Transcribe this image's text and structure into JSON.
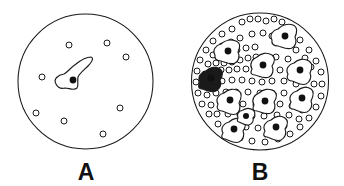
{
  "figure": {
    "background_color": "#ffffff",
    "line_color": "#1a1a1a",
    "width": 344,
    "height": 186
  },
  "panels": [
    {
      "id": "panel-a",
      "label": "A",
      "label_x": 86,
      "label_y": 180,
      "description": "Sparse culture: few round cells and a single spread amoeboid cell",
      "dish": {
        "cx": 85.5,
        "cy": 81.5,
        "r": 67.5
      },
      "bead_count": 8,
      "amoeba_count": 1,
      "beads": [
        {
          "cx": 69,
          "cy": 45,
          "r": 3.0
        },
        {
          "cx": 107,
          "cy": 43,
          "r": 3.0
        },
        {
          "cx": 126,
          "cy": 57,
          "r": 3.0
        },
        {
          "cx": 42,
          "cy": 77,
          "r": 3.0
        },
        {
          "cx": 120,
          "cy": 108,
          "r": 3.0
        },
        {
          "cx": 36,
          "cy": 113,
          "r": 3.0
        },
        {
          "cx": 64,
          "cy": 121,
          "r": 3.0
        },
        {
          "cx": 103,
          "cy": 134,
          "r": 3.0
        }
      ],
      "amoebae": [
        {
          "nucleus": {
            "cx": 73,
            "cy": 80,
            "r": 3.4
          },
          "filled": false,
          "path": "M 56 84 C 53 79 58 75 64 74 C 68 72 70 68 76 64 C 81 60 87 57 91 57 C 94 58 92 62 88 66 C 84 70 80 73 78 77 C 77 81 79 85 77 88 C 74 91 69 88 65 88 C 61 89 58 88 56 84 Z"
        }
      ]
    },
    {
      "id": "panel-b",
      "label": "B",
      "label_x": 260,
      "label_y": 180,
      "description": "Confluent culture: many round cells and numerous spread amoeboid cells",
      "dish": {
        "cx": 260,
        "cy": 81.5,
        "r": 68.5
      },
      "bead_count": 112,
      "amoeba_count": 11,
      "beads": [
        {
          "cx": 242,
          "cy": 22,
          "r": 3.0
        },
        {
          "cx": 250,
          "cy": 19,
          "r": 3.0
        },
        {
          "cx": 258,
          "cy": 19,
          "r": 3.0
        },
        {
          "cx": 266,
          "cy": 21,
          "r": 3.0
        },
        {
          "cx": 274,
          "cy": 19,
          "r": 3.0
        },
        {
          "cx": 282,
          "cy": 22,
          "r": 3.0
        },
        {
          "cx": 232,
          "cy": 29,
          "r": 3.0
        },
        {
          "cx": 222,
          "cy": 34,
          "r": 3.0
        },
        {
          "cx": 213,
          "cy": 41,
          "r": 3.0
        },
        {
          "cx": 206,
          "cy": 50,
          "r": 3.0
        },
        {
          "cx": 200,
          "cy": 60,
          "r": 3.0
        },
        {
          "cx": 197,
          "cy": 71,
          "r": 3.0
        },
        {
          "cx": 196,
          "cy": 82,
          "r": 3.0
        },
        {
          "cx": 198,
          "cy": 93,
          "r": 3.0
        },
        {
          "cx": 202,
          "cy": 104,
          "r": 3.0
        },
        {
          "cx": 209,
          "cy": 114,
          "r": 3.0
        },
        {
          "cx": 218,
          "cy": 124,
          "r": 3.0
        },
        {
          "cx": 228,
          "cy": 132,
          "r": 3.0
        },
        {
          "cx": 240,
          "cy": 138,
          "r": 3.0
        },
        {
          "cx": 252,
          "cy": 141,
          "r": 3.0
        },
        {
          "cx": 265,
          "cy": 142,
          "r": 3.0
        },
        {
          "cx": 278,
          "cy": 139,
          "r": 3.0
        },
        {
          "cx": 290,
          "cy": 134,
          "r": 3.0
        },
        {
          "cx": 300,
          "cy": 127,
          "r": 3.0
        },
        {
          "cx": 309,
          "cy": 118,
          "r": 3.0
        },
        {
          "cx": 316,
          "cy": 107,
          "r": 3.0
        },
        {
          "cx": 321,
          "cy": 96,
          "r": 3.0
        },
        {
          "cx": 322,
          "cy": 84,
          "r": 3.0
        },
        {
          "cx": 321,
          "cy": 72,
          "r": 3.0
        },
        {
          "cx": 316,
          "cy": 61,
          "r": 3.0
        },
        {
          "cx": 309,
          "cy": 50,
          "r": 3.0
        },
        {
          "cx": 300,
          "cy": 40,
          "r": 3.0
        },
        {
          "cx": 291,
          "cy": 32,
          "r": 3.0
        },
        {
          "cx": 222,
          "cy": 46,
          "r": 3.0
        },
        {
          "cx": 231,
          "cy": 42,
          "r": 3.0
        },
        {
          "cx": 240,
          "cy": 38,
          "r": 3.0
        },
        {
          "cx": 252,
          "cy": 34,
          "r": 3.0
        },
        {
          "cx": 263,
          "cy": 33,
          "r": 3.0
        },
        {
          "cx": 272,
          "cy": 36,
          "r": 3.0
        },
        {
          "cx": 213,
          "cy": 55,
          "r": 3.0
        },
        {
          "cx": 221,
          "cy": 56,
          "r": 3.0
        },
        {
          "cx": 229,
          "cy": 53,
          "r": 3.0
        },
        {
          "cx": 237,
          "cy": 50,
          "r": 3.0
        },
        {
          "cx": 246,
          "cy": 48,
          "r": 3.0
        },
        {
          "cx": 255,
          "cy": 47,
          "r": 3.0
        },
        {
          "cx": 286,
          "cy": 44,
          "r": 3.0
        },
        {
          "cx": 296,
          "cy": 50,
          "r": 3.0
        },
        {
          "cx": 305,
          "cy": 58,
          "r": 3.0
        },
        {
          "cx": 311,
          "cy": 67,
          "r": 3.0
        },
        {
          "cx": 208,
          "cy": 64,
          "r": 3.0
        },
        {
          "cx": 216,
          "cy": 63,
          "r": 3.0
        },
        {
          "cx": 224,
          "cy": 63,
          "r": 3.0
        },
        {
          "cx": 232,
          "cy": 62,
          "r": 3.0
        },
        {
          "cx": 240,
          "cy": 60,
          "r": 3.0
        },
        {
          "cx": 248,
          "cy": 58,
          "r": 3.0
        },
        {
          "cx": 256,
          "cy": 57,
          "r": 3.0
        },
        {
          "cx": 266,
          "cy": 58,
          "r": 3.0
        },
        {
          "cx": 276,
          "cy": 57,
          "r": 3.0
        },
        {
          "cx": 288,
          "cy": 59,
          "r": 3.0
        },
        {
          "cx": 298,
          "cy": 66,
          "r": 3.0
        },
        {
          "cx": 306,
          "cy": 76,
          "r": 3.0
        },
        {
          "cx": 205,
          "cy": 74,
          "r": 3.0
        },
        {
          "cx": 213,
          "cy": 71,
          "r": 3.0
        },
        {
          "cx": 221,
          "cy": 70,
          "r": 3.0
        },
        {
          "cx": 229,
          "cy": 70,
          "r": 3.0
        },
        {
          "cx": 237,
          "cy": 69,
          "r": 3.0
        },
        {
          "cx": 246,
          "cy": 69,
          "r": 3.0
        },
        {
          "cx": 256,
          "cy": 70,
          "r": 3.0
        },
        {
          "cx": 268,
          "cy": 70,
          "r": 3.0
        },
        {
          "cx": 280,
          "cy": 70,
          "r": 3.0
        },
        {
          "cx": 314,
          "cy": 84,
          "r": 3.0
        },
        {
          "cx": 206,
          "cy": 84,
          "r": 3.0
        },
        {
          "cx": 214,
          "cy": 82,
          "r": 3.0
        },
        {
          "cx": 222,
          "cy": 81,
          "r": 3.0
        },
        {
          "cx": 232,
          "cy": 80,
          "r": 3.0
        },
        {
          "cx": 242,
          "cy": 80,
          "r": 3.0
        },
        {
          "cx": 252,
          "cy": 81,
          "r": 3.0
        },
        {
          "cx": 262,
          "cy": 82,
          "r": 3.0
        },
        {
          "cx": 272,
          "cy": 81,
          "r": 3.0
        },
        {
          "cx": 284,
          "cy": 81,
          "r": 3.0
        },
        {
          "cx": 296,
          "cy": 84,
          "r": 3.0
        },
        {
          "cx": 306,
          "cy": 90,
          "r": 3.0
        },
        {
          "cx": 207,
          "cy": 95,
          "r": 3.0
        },
        {
          "cx": 216,
          "cy": 93,
          "r": 3.0
        },
        {
          "cx": 226,
          "cy": 92,
          "r": 3.0
        },
        {
          "cx": 236,
          "cy": 92,
          "r": 3.0
        },
        {
          "cx": 248,
          "cy": 92,
          "r": 3.0
        },
        {
          "cx": 260,
          "cy": 93,
          "r": 3.0
        },
        {
          "cx": 272,
          "cy": 93,
          "r": 3.0
        },
        {
          "cx": 284,
          "cy": 93,
          "r": 3.0
        },
        {
          "cx": 296,
          "cy": 96,
          "r": 3.0
        },
        {
          "cx": 308,
          "cy": 100,
          "r": 3.0
        },
        {
          "cx": 211,
          "cy": 105,
          "r": 3.0
        },
        {
          "cx": 221,
          "cy": 103,
          "r": 3.0
        },
        {
          "cx": 231,
          "cy": 103,
          "r": 3.0
        },
        {
          "cx": 243,
          "cy": 104,
          "r": 3.0
        },
        {
          "cx": 256,
          "cy": 105,
          "r": 3.0
        },
        {
          "cx": 268,
          "cy": 104,
          "r": 3.0
        },
        {
          "cx": 280,
          "cy": 104,
          "r": 3.0
        },
        {
          "cx": 292,
          "cy": 106,
          "r": 3.0
        },
        {
          "cx": 302,
          "cy": 110,
          "r": 3.0
        },
        {
          "cx": 217,
          "cy": 114,
          "r": 3.0
        },
        {
          "cx": 228,
          "cy": 114,
          "r": 3.0
        },
        {
          "cx": 240,
          "cy": 115,
          "r": 3.0
        },
        {
          "cx": 252,
          "cy": 116,
          "r": 3.0
        },
        {
          "cx": 264,
          "cy": 116,
          "r": 3.0
        },
        {
          "cx": 277,
          "cy": 115,
          "r": 3.0
        },
        {
          "cx": 289,
          "cy": 115,
          "r": 3.0
        },
        {
          "cx": 299,
          "cy": 119,
          "r": 3.0
        },
        {
          "cx": 232,
          "cy": 125,
          "r": 3.0
        },
        {
          "cx": 246,
          "cy": 127,
          "r": 3.0
        },
        {
          "cx": 258,
          "cy": 128,
          "r": 3.0
        },
        {
          "cx": 270,
          "cy": 127,
          "r": 3.0
        },
        {
          "cx": 284,
          "cy": 126,
          "r": 3.0
        }
      ],
      "amoebae": [
        {
          "nucleus": {
            "cx": 285,
            "cy": 36,
            "r": 3.4
          },
          "filled": false,
          "path": "M 272 40 C 269 35 273 30 278 29 C 282 25 288 23 293 25 C 298 27 297 33 295 37 C 297 41 296 46 292 48 C 287 50 282 47 278 46 C 274 46 271 44 272 40 Z"
        },
        {
          "nucleus": {
            "cx": 228,
            "cy": 51,
            "r": 3.4
          },
          "filled": false,
          "path": "M 215 55 C 212 50 216 45 221 44 C 225 40 231 39 236 41 C 241 43 240 48 238 52 C 240 56 239 61 235 63 C 230 65 225 62 221 61 C 217 61 214 59 215 55 Z"
        },
        {
          "nucleus": {
            "cx": 263,
            "cy": 65,
            "r": 3.4
          },
          "filled": false,
          "path": "M 252 69 C 249 64 252 59 257 57 C 261 53 267 52 272 55 C 276 58 274 63 272 66 C 274 70 273 75 269 77 C 264 79 259 76 255 75 C 251 75 250 73 252 69 Z"
        },
        {
          "nucleus": {
            "cx": 300,
            "cy": 70,
            "r": 3.4
          },
          "filled": false,
          "path": "M 288 74 C 285 69 289 64 294 63 C 298 59 304 58 309 61 C 313 64 312 69 310 73 C 312 77 310 82 306 84 C 301 86 296 82 292 81 C 288 81 286 78 288 74 Z"
        },
        {
          "nucleus": {
            "cx": 211,
            "cy": 78,
            "r": 3.4
          },
          "filled": true,
          "path": "M 200 82 C 197 77 201 72 206 71 C 210 67 216 66 220 69 C 224 72 222 77 220 80 C 222 84 220 89 216 91 C 211 93 206 90 202 89 C 198 89 198 86 200 82 Z"
        },
        {
          "nucleus": {
            "cx": 230,
            "cy": 100,
            "r": 3.4
          },
          "filled": false,
          "path": "M 218 104 C 215 99 219 94 224 93 C 228 89 234 88 239 91 C 243 94 241 99 239 103 C 241 107 240 112 236 114 C 231 116 226 112 222 111 C 218 111 216 108 218 104 Z"
        },
        {
          "nucleus": {
            "cx": 265,
            "cy": 101,
            "r": 3.4
          },
          "filled": false,
          "path": "M 254 105 C 251 100 254 95 259 93 C 263 89 269 88 274 91 C 278 94 276 99 274 102 C 276 106 275 111 271 113 C 266 115 261 112 257 111 C 253 111 252 109 254 105 Z"
        },
        {
          "nucleus": {
            "cx": 302,
            "cy": 98,
            "r": 3.4
          },
          "filled": false,
          "path": "M 291 102 C 288 97 292 92 297 91 C 301 87 307 86 311 89 C 315 92 313 97 311 101 C 313 105 311 110 307 112 C 302 114 297 110 293 109 C 289 109 289 106 291 102 Z"
        },
        {
          "nucleus": {
            "cx": 234,
            "cy": 129,
            "r": 3.4
          },
          "filled": false,
          "path": "M 223 133 C 220 128 224 123 229 122 C 233 118 239 117 243 120 C 247 123 245 128 243 131 C 245 135 243 140 239 142 C 234 144 229 140 225 139 C 221 139 221 136 223 133 Z"
        },
        {
          "nucleus": {
            "cx": 276,
            "cy": 127,
            "r": 3.4
          },
          "filled": false,
          "path": "M 265 131 C 262 126 266 121 271 120 C 275 116 281 115 285 118 C 289 121 287 126 285 129 C 287 133 285 138 281 140 C 276 142 271 138 267 137 C 263 137 263 134 265 131 Z"
        },
        {
          "nucleus": {
            "cx": 246,
            "cy": 116,
            "r": 3.0
          },
          "filled": false,
          "path": "M 238 118 C 236 114 239 111 243 110 C 246 108 250 108 253 110 C 256 112 255 116 253 118 C 254 121 252 124 249 125 C 245 126 242 123 239 122 C 237 122 237 120 238 118 Z"
        }
      ]
    }
  ]
}
